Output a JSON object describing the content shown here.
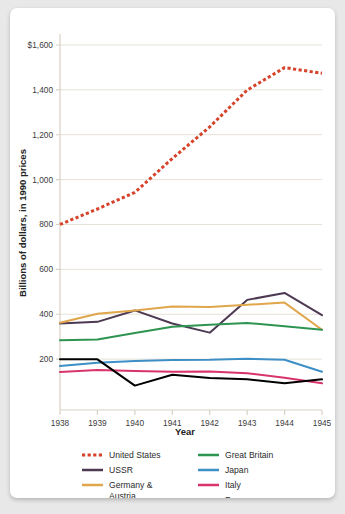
{
  "chart_data": {
    "type": "line",
    "title": "",
    "xlabel": "Year",
    "ylabel": "Billions of dollars, in 1990 prices",
    "x": [
      1938,
      1939,
      1940,
      1941,
      1942,
      1943,
      1944,
      1945
    ],
    "xtick_labels": [
      "1938",
      "1939",
      "1940",
      "1941",
      "1942",
      "1943",
      "1944",
      "1945"
    ],
    "ytick_labels": [
      "$1,600",
      "1,400",
      "1,200",
      "1,000",
      "800",
      "600",
      "400",
      "200"
    ],
    "ytick_values": [
      1600,
      1400,
      1200,
      1000,
      800,
      600,
      400,
      200
    ],
    "ylim": [
      0,
      1640
    ],
    "xlim": [
      1938,
      1945
    ],
    "grid": true,
    "legend_position": "bottom",
    "series": [
      {
        "name": "United States",
        "color": "#d6432a",
        "style": "dotted",
        "values": [
          800,
          869,
          943,
          1094,
          1235,
          1399,
          1499,
          1474
        ]
      },
      {
        "name": "USSR",
        "color": "#4d3a52",
        "style": "solid",
        "values": [
          359,
          366,
          417,
          359,
          318,
          464,
          495,
          396
        ]
      },
      {
        "name": "Germany & Austria",
        "color": "#e0a64b",
        "style": "solid",
        "values": [
          362,
          402,
          417,
          434,
          432,
          442,
          452,
          331
        ]
      },
      {
        "name": "Great Britain",
        "color": "#2e9451",
        "style": "solid",
        "values": [
          284,
          287,
          316,
          344,
          353,
          361,
          346,
          331
        ]
      },
      {
        "name": "Japan",
        "color": "#3d8fc6",
        "style": "solid",
        "values": [
          169,
          184,
          192,
          196,
          197,
          202,
          197,
          144
        ]
      },
      {
        "name": "Italy",
        "color": "#d9336c",
        "style": "solid",
        "values": [
          143,
          151,
          147,
          144,
          145,
          137,
          117,
          92
        ]
      },
      {
        "name": "France",
        "color": "#000000",
        "style": "solid",
        "values": [
          199,
          199,
          82,
          130,
          116,
          110,
          93,
          110
        ]
      }
    ]
  },
  "legend": {
    "column_left": [
      {
        "label": "United States",
        "color": "#d6432a",
        "style": "dotted"
      },
      {
        "label": "USSR",
        "color": "#4d3a52",
        "style": "solid"
      },
      {
        "label": "Germany &\nAustria",
        "color": "#e0a64b",
        "style": "solid"
      }
    ],
    "column_right": [
      {
        "label": "Great Britain",
        "color": "#2e9451",
        "style": "solid"
      },
      {
        "label": "Japan",
        "color": "#3d8fc6",
        "style": "solid"
      },
      {
        "label": "Italy",
        "color": "#d9336c",
        "style": "solid"
      },
      {
        "label": "France",
        "color": "#000000",
        "style": "solid"
      }
    ]
  },
  "style": {
    "grid_color": "#e7e2d8",
    "axis_color": "#d8d2c4",
    "card_background": "#ffffff",
    "page_background": "#e8e8e8"
  }
}
